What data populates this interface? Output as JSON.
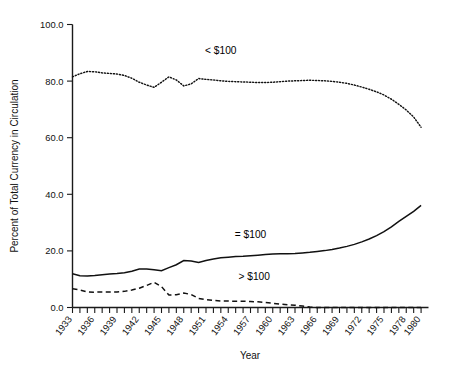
{
  "chart_data": {
    "type": "line",
    "title": "",
    "xlabel": "Year",
    "ylabel": "Percent of Total Currency in Circulation",
    "xlim": [
      1933,
      1981
    ],
    "ylim": [
      0.0,
      100.0
    ],
    "grid": false,
    "legend_position": "inline-annotations",
    "y_ticks": [
      "0.0",
      "20.0",
      "40.0",
      "60.0",
      "80.0",
      "100.0"
    ],
    "y_tick_values": [
      0,
      20,
      40,
      60,
      80,
      100
    ],
    "x_ticks": [
      "1933",
      "1936",
      "1939",
      "1942",
      "1945",
      "1948",
      "1951",
      "1954",
      "1957",
      "1960",
      "1963",
      "1966",
      "1969",
      "1972",
      "1975",
      "1978",
      "1980"
    ],
    "x_tick_values": [
      1933,
      1936,
      1939,
      1942,
      1945,
      1948,
      1951,
      1954,
      1957,
      1960,
      1963,
      1966,
      1969,
      1972,
      1975,
      1978,
      1980
    ],
    "x": [
      1933,
      1934,
      1935,
      1936,
      1937,
      1938,
      1939,
      1940,
      1941,
      1942,
      1943,
      1944,
      1945,
      1946,
      1947,
      1948,
      1949,
      1950,
      1951,
      1952,
      1953,
      1954,
      1955,
      1956,
      1957,
      1958,
      1959,
      1960,
      1961,
      1962,
      1963,
      1964,
      1965,
      1966,
      1967,
      1968,
      1969,
      1970,
      1971,
      1972,
      1973,
      1974,
      1975,
      1976,
      1977,
      1978,
      1979,
      1980
    ],
    "series": [
      {
        "name": "< $100",
        "label": "< $100",
        "style": "dotted",
        "annotation_x": 1953.0,
        "annotation_y": 89.5,
        "values": [
          81.5,
          82.6,
          83.4,
          83.3,
          82.9,
          82.7,
          82.5,
          82.0,
          81.0,
          79.6,
          78.6,
          77.8,
          79.6,
          81.5,
          80.4,
          78.3,
          79.0,
          80.9,
          80.6,
          80.4,
          80.1,
          79.9,
          79.8,
          79.7,
          79.6,
          79.5,
          79.5,
          79.6,
          79.8,
          80.0,
          80.1,
          80.2,
          80.3,
          80.2,
          80.1,
          79.9,
          79.6,
          79.2,
          78.6,
          77.9,
          77.1,
          76.2,
          75.1,
          73.6,
          71.8,
          69.8,
          67.3,
          63.7
        ]
      },
      {
        "name": "= $100",
        "label": "= $100",
        "style": "solid",
        "annotation_x": 1957.0,
        "annotation_y": 24.6,
        "values": [
          11.9,
          11.2,
          11.1,
          11.3,
          11.6,
          11.8,
          12.0,
          12.3,
          12.8,
          13.6,
          13.6,
          13.3,
          13.0,
          14.1,
          15.1,
          16.6,
          16.4,
          15.9,
          16.6,
          17.1,
          17.6,
          17.8,
          18.0,
          18.1,
          18.3,
          18.5,
          18.7,
          18.9,
          19.0,
          19.0,
          19.1,
          19.3,
          19.5,
          19.8,
          20.1,
          20.5,
          21.0,
          21.6,
          22.3,
          23.2,
          24.2,
          25.4,
          26.8,
          28.5,
          30.4,
          32.2,
          34.0,
          36.1
        ]
      },
      {
        "name": "> $100",
        "label": "> $100",
        "style": "dashed",
        "annotation_x": 1957.5,
        "annotation_y": 9.6,
        "values": [
          6.6,
          6.2,
          5.5,
          5.4,
          5.5,
          5.5,
          5.5,
          5.7,
          6.2,
          6.8,
          7.8,
          8.9,
          7.4,
          4.4,
          4.5,
          5.1,
          4.6,
          3.2,
          2.8,
          2.5,
          2.3,
          2.3,
          2.2,
          2.2,
          2.1,
          2.0,
          1.8,
          1.5,
          1.2,
          1.0,
          0.8,
          0.5,
          0.2,
          0.0,
          0.0,
          0.0,
          0.0,
          0.0,
          0.0,
          0.0,
          0.0,
          0.0,
          0.0,
          0.0,
          0.0,
          0.0,
          0.0,
          0.0
        ]
      }
    ]
  }
}
